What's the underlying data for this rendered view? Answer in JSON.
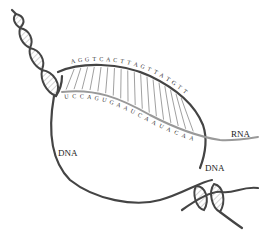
{
  "diagram": {
    "labels": {
      "rna": "RNA",
      "dna_left": "DNA",
      "dna_right": "DNA"
    },
    "template_strand_bases": [
      "A",
      "G",
      "G",
      "T",
      "C",
      "A",
      "C",
      "T",
      "T",
      "A",
      "G",
      "T",
      "T",
      "A",
      "T",
      "G",
      "T",
      "T"
    ],
    "rna_strand_bases": [
      "U",
      "C",
      "C",
      "A",
      "G",
      "U",
      "G",
      "A",
      "A",
      "U",
      "C",
      "A",
      "A",
      "U",
      "A",
      "C",
      "A",
      "A"
    ],
    "colors": {
      "dna": "#444444",
      "rna": "#999999",
      "text": "#222222"
    }
  }
}
